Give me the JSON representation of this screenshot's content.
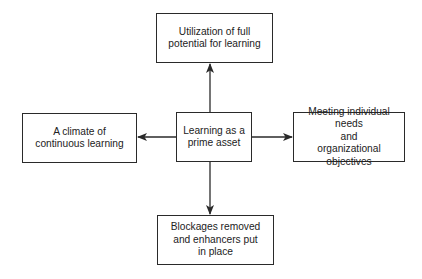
{
  "diagram": {
    "type": "hub-and-spoke flowchart",
    "colors": {
      "stroke": "#2a2a2a",
      "text": "#222222",
      "background": "#ffffff"
    },
    "nodes": {
      "center": {
        "label": "Learning as a\nprime asset"
      },
      "top": {
        "label": "Utilization of full\npotential for learning"
      },
      "left": {
        "label": "A climate of\ncontinuous learning"
      },
      "right": {
        "label": "Meeting individual needs\nand\norganizational objectives"
      },
      "bottom": {
        "label": "Blockages removed\nand enhancers put\nin place"
      }
    },
    "edges": [
      {
        "from": "center",
        "to": "top",
        "direction": "up"
      },
      {
        "from": "center",
        "to": "left",
        "direction": "left"
      },
      {
        "from": "center",
        "to": "right",
        "direction": "right"
      },
      {
        "from": "center",
        "to": "bottom",
        "direction": "down"
      }
    ]
  }
}
